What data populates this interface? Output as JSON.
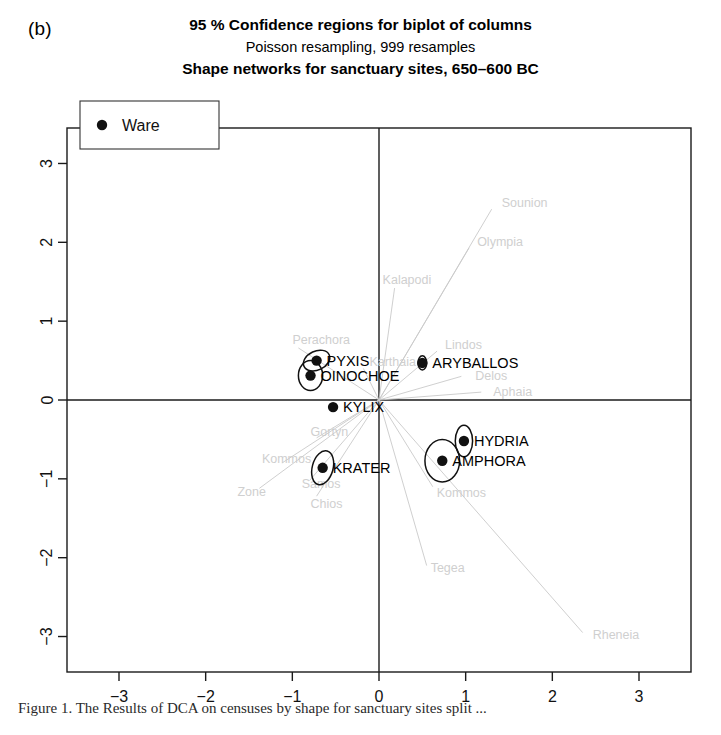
{
  "panel": {
    "letter": "(b)"
  },
  "titles": {
    "line1": "95 % Confidence regions for biplot of columns",
    "line2": "Poisson resampling, 999 resamples",
    "line3": "Shape networks for sanctuary sites, 650–600 BC"
  },
  "legend": {
    "label": "Ware",
    "marker": "filled-circle"
  },
  "caption": {
    "text": "Figure 1. The Results of DCA on censuses by shape for sanctuary sites split ..."
  },
  "chart_data": {
    "type": "scatter",
    "title": "95 % Confidence regions for biplot of columns",
    "subtitle": "Poisson resampling, 999 resamples",
    "subtitle2": "Shape networks for sanctuary sites, 650–600 BC",
    "xlabel": "",
    "ylabel": "",
    "xlim": [
      -3.6,
      3.6
    ],
    "ylim": [
      -3.45,
      3.45
    ],
    "xticks": [
      -3,
      -2,
      -1,
      0,
      1,
      2,
      3
    ],
    "yticks": [
      -3,
      -2,
      -1,
      0,
      1,
      2,
      3
    ],
    "grid": false,
    "axis_lines_at_zero": true,
    "legend_position": "top-left",
    "legend_entries": [
      "Ware"
    ],
    "series": [
      {
        "name": "Ware",
        "marker": "filled-circle",
        "points": [
          {
            "label": "PYXIS",
            "x": -0.72,
            "y": 0.5,
            "ellipse_rx": 0.16,
            "ellipse_ry": 0.12,
            "ellipse_rot": -25,
            "label_pos": "right"
          },
          {
            "label": "OINOCHOE",
            "x": -0.79,
            "y": 0.31,
            "ellipse_rx": 0.14,
            "ellipse_ry": 0.19,
            "ellipse_rot": 0,
            "label_pos": "right"
          },
          {
            "label": "ARYBALLOS",
            "x": 0.5,
            "y": 0.47,
            "ellipse_rx": 0.05,
            "ellipse_ry": 0.09,
            "ellipse_rot": 0,
            "label_pos": "right"
          },
          {
            "label": "KYLIX",
            "x": -0.53,
            "y": -0.09,
            "ellipse_rx": 0.03,
            "ellipse_ry": 0.03,
            "ellipse_rot": 0,
            "label_pos": "right"
          },
          {
            "label": "HYDRIA",
            "x": 0.98,
            "y": -0.52,
            "ellipse_rx": 0.1,
            "ellipse_ry": 0.2,
            "ellipse_rot": 0,
            "label_pos": "right"
          },
          {
            "label": "AMPHORA",
            "x": 0.73,
            "y": -0.77,
            "ellipse_rx": 0.2,
            "ellipse_ry": 0.27,
            "ellipse_rot": 0,
            "label_pos": "right"
          },
          {
            "label": "KRATER",
            "x": -0.65,
            "y": -0.86,
            "ellipse_rx": 0.12,
            "ellipse_ry": 0.22,
            "ellipse_rot": 15,
            "label_pos": "right"
          }
        ]
      }
    ],
    "site_rays": [
      {
        "label": "Sounion",
        "x": 1.3,
        "y": 2.42,
        "label_dx": 10,
        "label_dy": -2
      },
      {
        "label": "Olympia",
        "x": 1.04,
        "y": 1.93,
        "label_dx": 8,
        "label_dy": -2
      },
      {
        "label": "Kalapodi",
        "x": 0.18,
        "y": 1.42,
        "label_dx": -12,
        "label_dy": -4
      },
      {
        "label": "Lindos",
        "x": 0.67,
        "y": 0.62,
        "label_dx": 8,
        "label_dy": -2
      },
      {
        "label": "Perachora",
        "x": -0.93,
        "y": 0.66,
        "label_dx": -6,
        "label_dy": -4
      },
      {
        "label": "Karthaia",
        "x": -0.18,
        "y": 0.4,
        "label_dx": 6,
        "label_dy": -2
      },
      {
        "label": "Delos",
        "x": 0.95,
        "y": 0.3,
        "label_dx": 14,
        "label_dy": 4
      },
      {
        "label": "Aphaia",
        "x": 1.18,
        "y": 0.1,
        "label_dx": 12,
        "label_dy": 4
      },
      {
        "label": "Gortyn",
        "x": -0.72,
        "y": -0.48,
        "label_dx": -6,
        "label_dy": -2
      },
      {
        "label": "Kommos2",
        "x": -1.12,
        "y": -0.8,
        "label_dx": -20,
        "label_dy": 0
      },
      {
        "label": "Samos",
        "x": -0.8,
        "y": -1.02,
        "label_dx": -8,
        "label_dy": 8
      },
      {
        "label": "Zone",
        "x": -1.38,
        "y": -1.12,
        "label_dx": -22,
        "label_dy": 8
      },
      {
        "label": "Chios",
        "x": -0.72,
        "y": -1.22,
        "label_dx": -6,
        "label_dy": 12
      },
      {
        "label": "Kommos",
        "x": 0.62,
        "y": -1.1,
        "label_dx": 4,
        "label_dy": 10
      },
      {
        "label": "Tegea",
        "x": 0.55,
        "y": -2.1,
        "label_dx": 4,
        "label_dy": 6
      },
      {
        "label": "Rheneia",
        "x": 2.35,
        "y": -2.95,
        "label_dx": 10,
        "label_dy": 6
      }
    ]
  }
}
